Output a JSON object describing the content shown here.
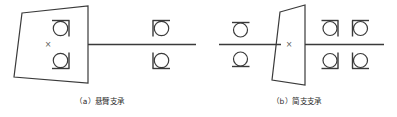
{
  "figure": {
    "background_color": "#ffffff",
    "line_color": "#3a3a3a",
    "text_color": "#2b2b2b",
    "width": 397,
    "height": 117
  },
  "diagrams": [
    {
      "id": "a",
      "caption": "（a）悬臂支承",
      "label": "(a)",
      "name": "悬臂支承",
      "shaft": {
        "x1": 88,
        "x2": 196,
        "y": 44
      },
      "gear": {
        "type": "trapezoid-with-cross",
        "top_left_x": 22,
        "top_y": 13,
        "bottom_left_x": 14,
        "bottom_y": 77,
        "right_x": 88,
        "cross_mark": "×",
        "cross_x": 48,
        "cross_y": 45
      },
      "bearings": [
        {
          "x": 61,
          "y": 28,
          "side": "right",
          "position": "upper-inner"
        },
        {
          "x": 61,
          "y": 60,
          "side": "right",
          "position": "lower-inner"
        },
        {
          "x": 161,
          "y": 28,
          "side": "left",
          "position": "upper-outer"
        },
        {
          "x": 161,
          "y": 60,
          "side": "left",
          "position": "lower-outer"
        }
      ]
    },
    {
      "id": "b",
      "caption": "（b）简支支承",
      "label": "(b)",
      "name": "简支支承",
      "shaft": {
        "x1": 219,
        "x2": 384,
        "y": 44
      },
      "gear": {
        "type": "trapezoid-with-cross",
        "top_left_x": 280,
        "top_y": 12,
        "bottom_left_x": 272,
        "bottom_y": 80,
        "right_x": 305,
        "cross_mark": "×",
        "cross_y": 45
      },
      "bearings": [
        {
          "x": 240,
          "y": 30,
          "side": "none",
          "position": "left-upper"
        },
        {
          "x": 240,
          "y": 59,
          "side": "none",
          "position": "left-lower"
        },
        {
          "x": 330,
          "y": 28,
          "side": "right",
          "position": "right-inner-upper"
        },
        {
          "x": 330,
          "y": 60,
          "side": "right",
          "position": "right-inner-lower"
        },
        {
          "x": 360,
          "y": 28,
          "side": "left",
          "position": "right-outer-upper"
        },
        {
          "x": 360,
          "y": 60,
          "side": "left",
          "position": "right-outer-lower"
        }
      ]
    }
  ]
}
